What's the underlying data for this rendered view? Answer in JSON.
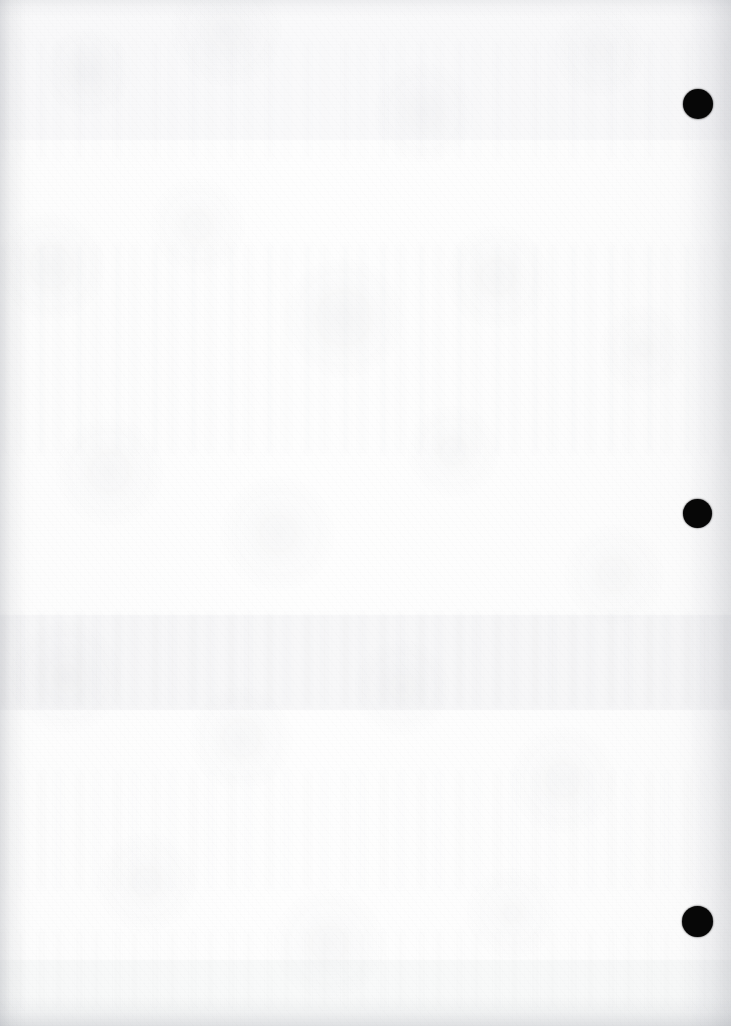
{
  "page": {
    "kind": "scanned-blank-page",
    "label": "Scanned blank page",
    "width_px": 731,
    "height_px": 1026,
    "orientation": "portrait",
    "visible_text": "",
    "paper_color": "#fcfcfc",
    "paper_tint": "#f4f4f5",
    "ink_color": "#070707",
    "notes_text": ""
  },
  "marks": {
    "label": "Binding register marks",
    "shape": "circle",
    "color": "#070707",
    "count": 3,
    "items": [
      {
        "name": "register-mark-top",
        "cx": 698,
        "cy": 104,
        "d": 30
      },
      {
        "name": "register-mark-middle",
        "cx": 697,
        "cy": 513,
        "d": 29
      },
      {
        "name": "register-mark-bottom",
        "cx": 697,
        "cy": 921,
        "d": 31
      }
    ]
  },
  "texture": {
    "label": "Paper grain and scanner noise",
    "showthrough_label": "Reverse-side show-through",
    "bands": [
      {
        "name": "showthrough-band-upper",
        "top": 244,
        "height": 210,
        "opacity": 0.4
      },
      {
        "name": "showthrough-band-middle",
        "top": 612,
        "height": 96,
        "opacity": 0.52
      },
      {
        "name": "showthrough-band-lower",
        "top": 770,
        "height": 120,
        "opacity": 0.34
      },
      {
        "name": "showthrough-band-top",
        "top": 40,
        "height": 120,
        "opacity": 0.26
      },
      {
        "name": "showthrough-band-bottom",
        "top": 930,
        "height": 80,
        "opacity": 0.3
      }
    ],
    "tone_bands": [
      {
        "name": "tone-band-upper",
        "top": 0,
        "height": 140,
        "color": "rgba(150,154,161,0.035)"
      },
      {
        "name": "tone-band-center",
        "top": 615,
        "height": 95,
        "color": "rgba(148,152,160,0.055)"
      },
      {
        "name": "tone-band-lower",
        "top": 960,
        "height": 66,
        "color": "rgba(150,154,161,0.045)"
      }
    ]
  }
}
